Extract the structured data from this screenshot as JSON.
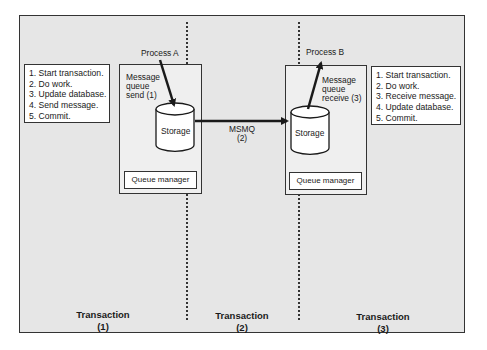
{
  "diagram": {
    "left_steps": [
      "1. Start transaction.",
      "2. Do work.",
      "3. Update database.",
      "4. Send message.",
      "5. Commit."
    ],
    "right_steps": [
      "1. Start transaction.",
      "2. Do work.",
      "3. Receive message.",
      "4. Update database.",
      "5. Commit."
    ],
    "process_a": "Process A",
    "process_b": "Process B",
    "send_label": [
      "Message",
      "queue",
      "send (1)"
    ],
    "receive_label": [
      "Message",
      "queue",
      "receive (3)"
    ],
    "storage_left": "Storage",
    "storage_right": "Storage",
    "queue_manager_left": "Queue manager",
    "queue_manager_right": "Queue manager",
    "msmq_label": [
      "MSMQ",
      "(2)"
    ],
    "transactions": [
      {
        "title": "Transaction",
        "number": "(1)"
      },
      {
        "title": "Transaction",
        "number": "(2)"
      },
      {
        "title": "Transaction",
        "number": "(3)"
      }
    ],
    "colors": {
      "background": "#e6e6e6",
      "box": "#ffffff",
      "line": "#1a1a1a"
    }
  }
}
